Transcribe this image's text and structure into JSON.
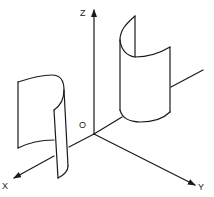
{
  "diagram": {
    "type": "3d-coordinate-axes-with-cylindrical-surfaces",
    "axes": {
      "x_label": "X",
      "y_label": "Y",
      "z_label": "Z",
      "origin_label": "O"
    },
    "surfaces": [
      {
        "name": "left-curved-surface",
        "position": "along X axis"
      },
      {
        "name": "right-curved-surface",
        "position": "along Y axis"
      }
    ],
    "colors": {
      "stroke": "#1a1a1a",
      "background": "#ffffff"
    }
  }
}
